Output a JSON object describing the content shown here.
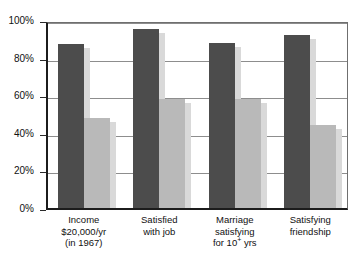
{
  "chart_data": {
    "type": "bar",
    "title": "",
    "subtitle": "",
    "xlabel": "",
    "ylabel": "",
    "ylim": [
      0,
      100
    ],
    "yunit": "%",
    "grid": true,
    "legend": "none",
    "categories": [
      "Income $20,000/yr (in 1967)",
      "Satisfied with job",
      "Marriage satisfying for 10+ yrs",
      "Satisfying friendship"
    ],
    "category_lines": [
      [
        "Income",
        "$20,000/yr",
        "(in 1967)"
      ],
      [
        "Satisfied",
        "with job"
      ],
      [
        "Marriage",
        "satisfying",
        "for 10+ yrs"
      ],
      [
        "Satisfying",
        "friendship"
      ]
    ],
    "series": [
      {
        "name": "dark",
        "color": "#4c4c4c",
        "values": [
          87,
          95,
          88,
          92
        ]
      },
      {
        "name": "light",
        "color": "#b9b9b9",
        "values": [
          48,
          58,
          58,
          44
        ]
      }
    ],
    "y_ticks": [
      0,
      20,
      40,
      60,
      80,
      100
    ],
    "y_tick_labels": [
      "0%",
      "20%",
      "40%",
      "60%",
      "80%",
      "100%"
    ]
  },
  "axis": {
    "y_tick_labels": [
      "100%",
      "80%",
      "60%",
      "40%",
      "20%",
      "0%"
    ]
  },
  "colors": {
    "bar_dark": "#4c4c4c",
    "bar_light": "#b9b9b9",
    "shadow": "#d9d9d9",
    "axis": "#1c1c1c",
    "grid": "#8d8d8d",
    "background": "#ffffff"
  }
}
